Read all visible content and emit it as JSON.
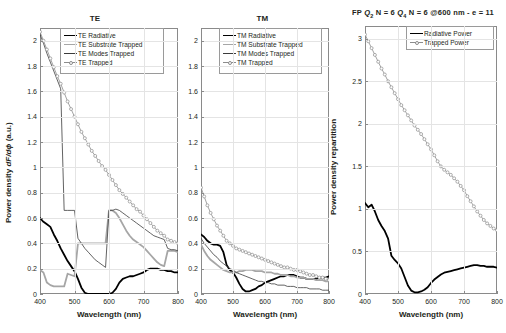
{
  "figure": {
    "axis_x_title": "Wavelength (nm)",
    "xticks": [
      "400",
      "500",
      "600",
      "700",
      "800"
    ]
  },
  "panels": {
    "te": {
      "title": "TE",
      "y_title_html": "Power density dF/dϕ (a.u.)",
      "yticks": [
        "0",
        "0.2",
        "0.4",
        "0.6",
        "0.8",
        "1",
        "1.2",
        "1.4",
        "1.6",
        "1.8",
        "2"
      ],
      "legend": [
        {
          "label": "TE Radiative",
          "style": "thick-black"
        },
        {
          "label": "TE Substrate Trapped",
          "style": "thick-gray"
        },
        {
          "label": "TE Modes Trapped",
          "style": "thin-black"
        },
        {
          "label": "TE Trapped",
          "style": "marker-gray"
        }
      ]
    },
    "tm": {
      "title": "TM",
      "yticks": [
        "0",
        "0.2",
        "0.4",
        "0.6",
        "0.8",
        "1",
        "1.2",
        "1.4",
        "1.6",
        "1.8",
        "2"
      ],
      "legend": [
        {
          "label": "TM Radiative",
          "style": "thick-black"
        },
        {
          "label": "TM Substrate Trapped",
          "style": "thick-gray"
        },
        {
          "label": "TM Modes Trapped",
          "style": "thin-black"
        },
        {
          "label": "TM Trapped",
          "style": "marker-gray"
        }
      ]
    },
    "fp": {
      "title": "FP Q2 N = 6 Q4 N = 6 @600 nm - e = 11",
      "title_parts": {
        "prefix": "FP ",
        "q1": "Q",
        "q1sub": "2",
        "mid1": " N = 6 ",
        "q2": "Q",
        "q2sub": "4",
        "mid2": " N = 6 @600 nm - e = 11"
      },
      "y_title": "Power density repartition",
      "yticks": [
        "0",
        "0.5",
        "1",
        "1.5",
        "2",
        "2.5",
        "3"
      ],
      "legend": [
        {
          "label": "Radiative Power",
          "style": "thick-black"
        },
        {
          "label": "Trapped Power",
          "style": "marker-gray"
        }
      ]
    }
  },
  "chart_data": [
    {
      "type": "line",
      "title": "TE",
      "xlabel": "Wavelength (nm)",
      "ylabel": "Power density dF/dphi (a.u.)",
      "xlim": [
        400,
        800
      ],
      "ylim": [
        0,
        2.1
      ],
      "grid": true,
      "legend_position": "top-right-inside",
      "x": [
        400,
        410,
        420,
        430,
        440,
        450,
        460,
        470,
        480,
        490,
        500,
        510,
        520,
        530,
        540,
        550,
        560,
        570,
        580,
        590,
        600,
        610,
        620,
        630,
        640,
        650,
        660,
        670,
        680,
        690,
        700,
        710,
        720,
        730,
        740,
        750,
        760,
        770,
        780,
        790,
        800
      ],
      "series": [
        {
          "name": "TE Radiative",
          "style": "thick-black",
          "values": [
            0.6,
            0.57,
            0.55,
            0.53,
            0.47,
            0.42,
            0.36,
            0.31,
            0.26,
            0.22,
            0.18,
            0.12,
            0.05,
            0.01,
            0.0,
            0.0,
            0.0,
            0.0,
            0.0,
            0.0,
            0.0,
            0.01,
            0.04,
            0.09,
            0.12,
            0.13,
            0.14,
            0.14,
            0.15,
            0.16,
            0.17,
            0.19,
            0.2,
            0.2,
            0.2,
            0.19,
            0.19,
            0.18,
            0.18,
            0.17,
            0.17
          ]
        },
        {
          "name": "TE Substrate Trapped",
          "style": "thick-gray",
          "values": [
            0.19,
            0.17,
            0.09,
            0.07,
            0.06,
            0.06,
            0.06,
            0.06,
            0.16,
            0.15,
            0.14,
            0.4,
            0.4,
            0.4,
            0.4,
            0.4,
            0.4,
            0.4,
            0.4,
            0.4,
            0.66,
            0.66,
            0.64,
            0.6,
            0.55,
            0.5,
            0.46,
            0.43,
            0.41,
            0.39,
            0.37,
            0.34,
            0.31,
            0.28,
            0.25,
            0.23,
            0.22,
            0.34,
            0.34,
            0.34,
            0.33
          ]
        },
        {
          "name": "TE Modes Trapped",
          "style": "thin-black",
          "values": [
            2.05,
            1.98,
            1.9,
            1.83,
            1.76,
            1.69,
            1.62,
            0.66,
            0.66,
            0.66,
            0.66,
            0.44,
            0.4,
            0.36,
            0.33,
            0.3,
            0.27,
            0.25,
            0.23,
            0.21,
            0.66,
            0.66,
            0.67,
            0.66,
            0.64,
            0.62,
            0.6,
            0.58,
            0.56,
            0.54,
            0.52,
            0.5,
            0.48,
            0.46,
            0.45,
            0.44,
            0.43,
            0.36,
            0.35,
            0.35,
            0.34
          ]
        },
        {
          "name": "TE Trapped",
          "style": "marker-gray",
          "values": [
            2.07,
            2.0,
            1.93,
            1.86,
            1.79,
            1.72,
            1.66,
            1.59,
            1.52,
            1.46,
            1.4,
            1.34,
            1.28,
            1.23,
            1.18,
            1.13,
            1.09,
            1.05,
            1.01,
            0.98,
            0.94,
            0.9,
            0.86,
            0.82,
            0.79,
            0.76,
            0.73,
            0.7,
            0.67,
            0.65,
            0.62,
            0.59,
            0.56,
            0.53,
            0.5,
            0.48,
            0.46,
            0.43,
            0.42,
            0.41,
            0.4
          ]
        }
      ]
    },
    {
      "type": "line",
      "title": "TM",
      "xlabel": "Wavelength (nm)",
      "ylabel": "Power density dF/dphi (a.u.)",
      "xlim": [
        400,
        800
      ],
      "ylim": [
        0,
        2.1
      ],
      "grid": true,
      "legend_position": "top-right-inside",
      "x": [
        400,
        410,
        420,
        430,
        440,
        450,
        460,
        470,
        480,
        490,
        500,
        510,
        520,
        530,
        540,
        550,
        560,
        570,
        580,
        590,
        600,
        610,
        620,
        630,
        640,
        650,
        660,
        670,
        680,
        690,
        700,
        710,
        720,
        730,
        740,
        750,
        760,
        770,
        780,
        790,
        800
      ],
      "series": [
        {
          "name": "TM Radiative",
          "style": "thick-black",
          "values": [
            0.47,
            0.45,
            0.42,
            0.4,
            0.39,
            0.39,
            0.38,
            0.33,
            0.23,
            0.19,
            0.17,
            0.13,
            0.08,
            0.04,
            0.02,
            0.02,
            0.03,
            0.04,
            0.06,
            0.07,
            0.09,
            0.1,
            0.11,
            0.12,
            0.13,
            0.14,
            0.14,
            0.15,
            0.15,
            0.15,
            0.14,
            0.13,
            0.13,
            0.12,
            0.12,
            0.12,
            0.12,
            0.13,
            0.13,
            0.13,
            0.14
          ]
        },
        {
          "name": "TM Substrate Trapped",
          "style": "thick-gray",
          "values": [
            0.39,
            0.34,
            0.3,
            0.27,
            0.25,
            0.23,
            0.21,
            0.19,
            0.18,
            0.17,
            0.17,
            0.17,
            0.18,
            0.18,
            0.19,
            0.19,
            0.19,
            0.18,
            0.18,
            0.18,
            0.17,
            0.17,
            0.17,
            0.16,
            0.16,
            0.15,
            0.15,
            0.15,
            0.14,
            0.14,
            0.13,
            0.13,
            0.13,
            0.12,
            0.12,
            0.12,
            0.11,
            0.11,
            0.11,
            0.1,
            0.1
          ]
        },
        {
          "name": "TM Modes Trapped",
          "style": "thin-black",
          "values": [
            0.44,
            0.4,
            0.37,
            0.34,
            0.31,
            0.29,
            0.26,
            0.24,
            0.22,
            0.2,
            0.19,
            0.17,
            0.16,
            0.15,
            0.14,
            0.13,
            0.12,
            0.11,
            0.1,
            0.1,
            0.09,
            0.09,
            0.08,
            0.08,
            0.07,
            0.07,
            0.07,
            0.06,
            0.06,
            0.06,
            0.05,
            0.05,
            0.05,
            0.05,
            0.04,
            0.04,
            0.04,
            0.04,
            0.03,
            0.03,
            0.03
          ]
        },
        {
          "name": "TM Trapped",
          "style": "marker-gray",
          "values": [
            0.84,
            0.77,
            0.7,
            0.64,
            0.59,
            0.54,
            0.5,
            0.46,
            0.42,
            0.4,
            0.38,
            0.36,
            0.35,
            0.34,
            0.33,
            0.32,
            0.31,
            0.3,
            0.29,
            0.28,
            0.27,
            0.26,
            0.25,
            0.24,
            0.23,
            0.22,
            0.21,
            0.21,
            0.2,
            0.19,
            0.19,
            0.18,
            0.17,
            0.16,
            0.15,
            0.15,
            0.14,
            0.13,
            0.13,
            0.12,
            0.11
          ]
        }
      ]
    },
    {
      "type": "line",
      "title": "FP Q2 N = 6 Q4 N = 6 @600 nm - e = 11",
      "xlabel": "Wavelength (nm)",
      "ylabel": "Power density repartition",
      "xlim": [
        400,
        800
      ],
      "ylim": [
        0,
        3.15
      ],
      "grid": true,
      "legend_position": "top-right-inside",
      "x": [
        400,
        410,
        420,
        430,
        440,
        450,
        460,
        470,
        480,
        490,
        500,
        510,
        520,
        530,
        540,
        550,
        560,
        570,
        580,
        590,
        600,
        610,
        620,
        630,
        640,
        650,
        660,
        670,
        680,
        690,
        700,
        710,
        720,
        730,
        740,
        750,
        760,
        770,
        780,
        790,
        800
      ],
      "series": [
        {
          "name": "Radiative Power",
          "style": "thick-black",
          "values": [
            1.07,
            1.02,
            1.05,
            0.97,
            0.87,
            0.8,
            0.74,
            0.65,
            0.45,
            0.4,
            0.36,
            0.3,
            0.2,
            0.1,
            0.04,
            0.02,
            0.02,
            0.03,
            0.05,
            0.08,
            0.13,
            0.17,
            0.2,
            0.23,
            0.25,
            0.26,
            0.27,
            0.28,
            0.29,
            0.3,
            0.31,
            0.32,
            0.33,
            0.34,
            0.34,
            0.33,
            0.33,
            0.32,
            0.32,
            0.32,
            0.31
          ]
        },
        {
          "name": "Trapped Power",
          "style": "marker-gray",
          "values": [
            3.05,
            2.97,
            2.89,
            2.81,
            2.73,
            2.65,
            2.58,
            2.5,
            2.43,
            2.36,
            2.29,
            2.22,
            2.16,
            2.1,
            2.04,
            1.98,
            1.93,
            1.88,
            1.82,
            1.76,
            1.7,
            1.63,
            1.56,
            1.5,
            1.46,
            1.43,
            1.4,
            1.36,
            1.32,
            1.27,
            1.22,
            1.15,
            1.09,
            1.03,
            0.97,
            0.92,
            0.87,
            0.83,
            0.8,
            0.77,
            0.75
          ]
        }
      ]
    }
  ],
  "colors": {
    "thick_black": "#000000",
    "thick_gray": "#a6a6a6",
    "thin_black": "#3b3b3b",
    "marker_gray": "#8c8c8c",
    "grid": "#e4e4e4",
    "axis": "#8a8a8a"
  }
}
